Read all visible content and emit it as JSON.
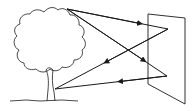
{
  "diagram": {
    "title": "",
    "elements": {
      "tree": "tree",
      "panel": "reflective panel",
      "rays": [
        {
          "from": "tree-top",
          "to": "panel-upper",
          "direction": "to-panel"
        },
        {
          "from": "tree-top",
          "to": "panel-lower",
          "direction": "to-panel"
        },
        {
          "from": "panel-upper",
          "to": "tree-trunk",
          "direction": "to-tree"
        },
        {
          "from": "panel-lower",
          "to": "tree-trunk",
          "direction": "to-tree"
        }
      ]
    },
    "colors": {
      "line": "#1a1a1a",
      "background": "#ffffff"
    }
  }
}
